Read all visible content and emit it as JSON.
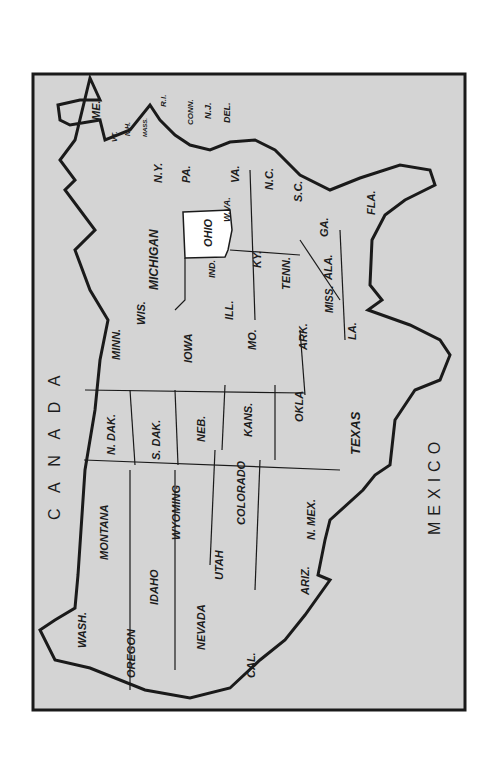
{
  "map": {
    "subject": "United States map (rotated 90°), Ohio highlighted",
    "highlighted_state": "OHIO",
    "colors": {
      "land": "#d4d4d4",
      "highlight": "#ffffff",
      "border": "#1a1a1a",
      "page": "#ffffff"
    },
    "regions": {
      "canada": "C A N A D A",
      "mexico": "MEXICO"
    },
    "states": {
      "me": "ME.",
      "vt": "VT.",
      "nh": "N.H.",
      "mass": "MASS.",
      "ri": "R.I.",
      "conn": "CONN.",
      "nj": "N.J.",
      "del": "DEL.",
      "ny": "N.Y.",
      "pa": "PA.",
      "va": "VA.",
      "wva": "W.VA.",
      "nc": "N.C.",
      "sc": "S.C.",
      "ga": "GA.",
      "fla": "FLA.",
      "ohio": "OHIO",
      "michigan": "MICHIGAN",
      "ind": "IND.",
      "ky": "KY.",
      "tenn": "TENN.",
      "ala": "ALA.",
      "miss": "MISS.",
      "wis": "WIS.",
      "ill": "ILL.",
      "minn": "MINN.",
      "iowa": "IOWA",
      "mo": "MO.",
      "ark": "ARK.",
      "la": "LA.",
      "ndak": "N. DAK.",
      "sdak": "S. DAK.",
      "neb": "NEB.",
      "kans": "KANS.",
      "okla": "OKLA",
      "texas": "TEXAS",
      "montana": "MONTANA",
      "wyoming": "WYOMING",
      "colorado": "COLORADO",
      "nmex": "N. MEX.",
      "idaho": "IDAHO",
      "utah": "UTAH",
      "ariz": "ARIZ.",
      "wash": "WASH.",
      "oregon": "OREGON",
      "nevada": "NEVADA",
      "cal": "CAL."
    }
  }
}
